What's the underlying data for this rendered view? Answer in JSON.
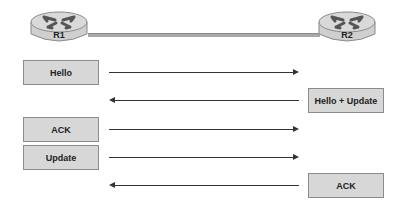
{
  "routers": [
    {
      "id": "r1",
      "label": "R1"
    },
    {
      "id": "r2",
      "label": "R2"
    }
  ],
  "messages": [
    {
      "label": "Hello",
      "side": "left",
      "direction": "R1->R2"
    },
    {
      "label": "Hello + Update",
      "side": "right",
      "direction": "R2->R1"
    },
    {
      "label": "ACK",
      "side": "left",
      "direction": "R1->R2"
    },
    {
      "label": "Update",
      "side": "left",
      "direction": "R1->R2"
    },
    {
      "label": "ACK",
      "side": "right",
      "direction": "R2->R1"
    }
  ],
  "colors": {
    "box_fill": "#d7d7d7",
    "box_border": "#8c8c8c",
    "link": "#a8a8a8",
    "arrow": "#333333"
  }
}
